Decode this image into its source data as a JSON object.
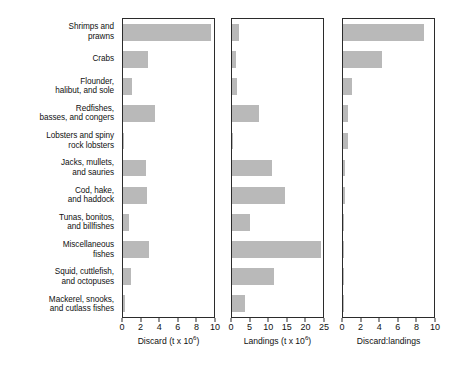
{
  "figure": {
    "title": "",
    "bar_color": "#b9b9b9",
    "axis_color": "#2b2b2b",
    "background": "#ffffff"
  },
  "categories": [
    {
      "lines": [
        "Shrimps and",
        "prawns"
      ]
    },
    {
      "lines": [
        "Crabs"
      ]
    },
    {
      "lines": [
        "Flounder,",
        "halibut, and sole"
      ]
    },
    {
      "lines": [
        "Redfishes,",
        "basses, and congers"
      ]
    },
    {
      "lines": [
        "Lobsters and spiny",
        "rock lobsters"
      ]
    },
    {
      "lines": [
        "Jacks, mullets,",
        "and sauries"
      ]
    },
    {
      "lines": [
        "Cod, hake,",
        "and haddock"
      ]
    },
    {
      "lines": [
        "Tunas, bonitos,",
        "and billfishes"
      ]
    },
    {
      "lines": [
        "Miscellaneous",
        "fishes"
      ]
    },
    {
      "lines": [
        "Squid, cuttlefish,",
        "and octopuses"
      ]
    },
    {
      "lines": [
        "Mackerel, snooks,",
        "and cutlass fishes"
      ]
    }
  ],
  "chart_data": [
    {
      "type": "bar",
      "orientation": "horizontal",
      "panel": "discard",
      "title": "",
      "xlabel": "Discard (t x 10⁶)",
      "xlabel_base": "Discard (t x 10",
      "xlabel_exp": "6",
      "xlabel_tail": ")",
      "ylabel": "",
      "xlim": [
        0,
        10
      ],
      "xticks": [
        0,
        2,
        4,
        6,
        8,
        10
      ],
      "xtick_labels": [
        "0",
        "2",
        "4",
        "6",
        "8",
        "10"
      ],
      "grid": false,
      "legend": "none",
      "categories": [
        "Shrimps and prawns",
        "Crabs",
        "Flounder, halibut, and sole",
        "Redfishes, basses, and congers",
        "Lobsters and spiny rock lobsters",
        "Jacks, mullets, and sauries",
        "Cod, hake, and haddock",
        "Tunas, bonitos, and billfishes",
        "Miscellaneous fishes",
        "Squid, cuttlefish, and octopuses",
        "Mackerel, snooks, and cutlass fishes"
      ],
      "values": [
        9.7,
        2.7,
        1.0,
        3.5,
        0.15,
        2.5,
        2.6,
        0.65,
        2.9,
        0.9,
        0.2
      ]
    },
    {
      "type": "bar",
      "orientation": "horizontal",
      "panel": "landings",
      "title": "",
      "xlabel": "Landings (t x 10⁶)",
      "xlabel_base": "Landings (t x 10",
      "xlabel_exp": "6",
      "xlabel_tail": ")",
      "ylabel": "",
      "xlim": [
        0,
        25
      ],
      "xticks": [
        0,
        5,
        10,
        15,
        20,
        25
      ],
      "xtick_labels": [
        "0",
        "5",
        "10",
        "15",
        "20",
        "25"
      ],
      "grid": false,
      "legend": "none",
      "categories": [
        "Shrimps and prawns",
        "Crabs",
        "Flounder, halibut, and sole",
        "Redfishes, basses, and congers",
        "Lobsters and spiny rock lobsters",
        "Jacks, mullets, and sauries",
        "Cod, hake, and haddock",
        "Tunas, bonitos, and billfishes",
        "Miscellaneous fishes",
        "Squid, cuttlefish, and octopuses",
        "Mackerel, snooks, and cutlass fishes"
      ],
      "values": [
        1.8,
        1.2,
        1.4,
        7.5,
        0.3,
        11.0,
        14.5,
        5.0,
        24.5,
        11.5,
        3.5
      ]
    },
    {
      "type": "bar",
      "orientation": "horizontal",
      "panel": "ratio",
      "title": "",
      "xlabel": "Discard:landings",
      "xlabel_base": "Discard:landings",
      "xlabel_exp": "",
      "xlabel_tail": "",
      "ylabel": "",
      "xlim": [
        0,
        10
      ],
      "xticks": [
        0,
        2,
        4,
        6,
        8,
        10
      ],
      "xtick_labels": [
        "0",
        "2",
        "4",
        "6",
        "8",
        "10"
      ],
      "grid": false,
      "legend": "none",
      "categories": [
        "Shrimps and prawns",
        "Crabs",
        "Flounder, halibut, and sole",
        "Redfishes, basses, and congers",
        "Lobsters and spiny rock lobsters",
        "Jacks, mullets, and sauries",
        "Cod, hake, and haddock",
        "Tunas, bonitos, and billfishes",
        "Miscellaneous fishes",
        "Squid, cuttlefish, and octopuses",
        "Mackerel, snooks, and cutlass fishes"
      ],
      "values": [
        8.9,
        4.3,
        1.0,
        0.55,
        0.55,
        0.25,
        0.2,
        0.15,
        0.12,
        0.1,
        0.07
      ]
    }
  ]
}
